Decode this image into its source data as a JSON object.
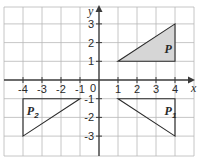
{
  "diagram": {
    "type": "coordinate-grid-transformations",
    "axes": {
      "x_label": "x",
      "y_label": "y",
      "x_ticks": [
        "-4",
        "-3",
        "-2",
        "-1",
        "1",
        "2",
        "3",
        "4"
      ],
      "y_ticks": [
        "3",
        "2",
        "1",
        "-1",
        "-2",
        "-3"
      ],
      "origin_label": "0",
      "x_range": [
        -5,
        5
      ],
      "y_range": [
        -4,
        4
      ]
    },
    "shapes": [
      {
        "id": "P",
        "label": "P",
        "subscript": "",
        "vertices": [
          [
            1,
            1
          ],
          [
            4,
            1
          ],
          [
            4,
            3
          ]
        ],
        "fill": "#d6d6d6",
        "label_pos": [
          3.45,
          1.65
        ]
      },
      {
        "id": "P1",
        "label": "P",
        "subscript": "1",
        "vertices": [
          [
            1,
            -1
          ],
          [
            4,
            -1
          ],
          [
            4,
            -3
          ]
        ],
        "fill": "none",
        "label_pos": [
          3.45,
          -1.65
        ]
      },
      {
        "id": "P2",
        "label": "P",
        "subscript": "2",
        "vertices": [
          [
            -1,
            -1
          ],
          [
            -4,
            -1
          ],
          [
            -4,
            -3
          ]
        ],
        "fill": "none",
        "label_pos": [
          -3.8,
          -1.65
        ]
      }
    ],
    "colors": {
      "grid": "#b8b8b8",
      "axis": "#3a3a3a",
      "shape_P_fill": "#d6d6d6"
    }
  }
}
